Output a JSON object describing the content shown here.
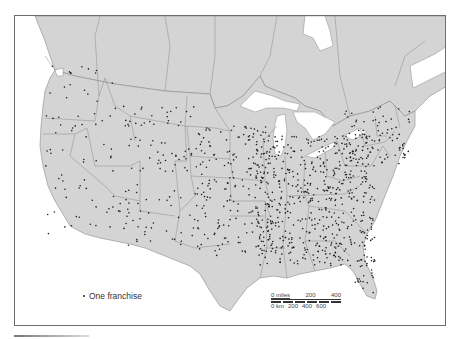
{
  "map": {
    "title": "",
    "region": "United States and southern Canada",
    "symbol_legend": {
      "symbol": "dot",
      "label": "One franchise"
    },
    "scale_bar": {
      "miles_label": "0 miles",
      "miles_ticks": [
        "200",
        "400"
      ],
      "km_label": "0 km",
      "km_ticks": [
        "200",
        "400",
        "600"
      ]
    },
    "colors": {
      "land": "#d4d4d4",
      "water": "#ffffff",
      "border": "#8a8a8a",
      "dot": "#1e1e1e",
      "frame": "#6d6d6d"
    }
  }
}
